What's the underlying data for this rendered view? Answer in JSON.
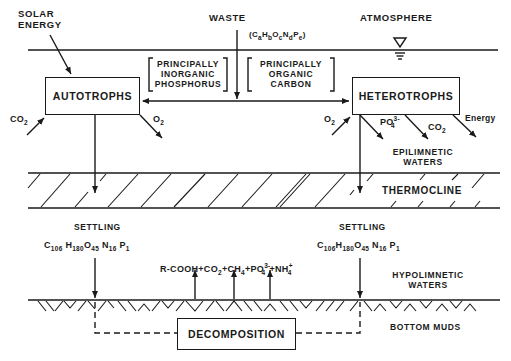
{
  "labels": {
    "solar_energy_line1": "SOLAR",
    "solar_energy_line2": "ENERGY",
    "waste": "WASTE",
    "atmosphere": "ATMOSPHERE",
    "waste_formula": {
      "C": "C",
      "a": "a",
      "H": "H",
      "b": "b",
      "O": "O",
      "c": "c",
      "N": "N",
      "d": "d",
      "P": "P",
      "e": "e"
    },
    "inorganic_phosphorus": [
      "PRINCIPALLY",
      "INORGANIC",
      "PHOSPHORUS"
    ],
    "organic_carbon": [
      "PRINCIPALLY",
      "ORGANIC",
      "CARBON"
    ],
    "epilimnetic_waters": [
      "EPILIMNETIC",
      "WATERS"
    ],
    "thermocline": "THERMOCLINE",
    "hypolimnetic_waters": [
      "HYPOLIMNETIC",
      "WATERS"
    ],
    "bottom_muds": "BOTTOM MUDS",
    "energy": "Energy"
  },
  "boxes": {
    "autotrophs": "AUTOTROPHS",
    "heterotrophs": "HETEROTROPHS",
    "decomposition": "DECOMPOSITION"
  },
  "autotroph_flows": {
    "input": {
      "base": "CO",
      "sub": "2"
    },
    "output": {
      "base": "O",
      "sub": "2"
    }
  },
  "heterotroph_flows": {
    "input": {
      "base": "O",
      "sub": "2"
    },
    "outputs": [
      {
        "base": "PO",
        "sub": "4",
        "sup": "3-"
      },
      {
        "base": "CO",
        "sub": "2"
      }
    ]
  },
  "settling": {
    "label": "SETTLING",
    "formula": [
      {
        "el": "C",
        "n": "106"
      },
      {
        "el": "H",
        "n": "180"
      },
      {
        "el": "O",
        "n": "45"
      },
      {
        "el": "N",
        "n": "16"
      },
      {
        "el": "P",
        "n": "1"
      }
    ]
  },
  "decomposition_products": {
    "r_cooh": "R-COOH",
    "plus": "+",
    "co2": {
      "base": "CO",
      "sub": "2"
    },
    "ch4": {
      "base": "CH",
      "sub": "4"
    },
    "po4": {
      "base": "PO",
      "sub": "4",
      "sup": "3-"
    },
    "nh4": {
      "base": "NH",
      "sub": "4",
      "sup": "+"
    }
  },
  "colors": {
    "ink": "#1a1a1a",
    "background": "#ffffff"
  }
}
